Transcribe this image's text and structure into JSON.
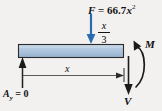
{
  "diagram": {
    "background_color": "#f2f1ef",
    "beam": {
      "fill_color": "#a8c0dc",
      "stroke_color": "#2b2b2b",
      "name": "beam-segment"
    },
    "labels": {
      "force_symbol": "F",
      "force_equals": " = 66.7",
      "force_variable": "x",
      "force_exponent": "2",
      "force_full": "F = 66.7x²",
      "centroid_numerator": "x",
      "centroid_denominator": "3",
      "centroid_full": "x/3",
      "length_dimension": "x",
      "reaction_symbol": "A",
      "reaction_subscript": "y",
      "reaction_equals": " = 0",
      "reaction_full": "A_y = 0",
      "moment": "M",
      "shear": "V"
    },
    "colors": {
      "force_arrow": "#2b6cb0",
      "line": "#2b2b2b",
      "beam_fill_top": "#c3d4e6",
      "beam_fill_bottom": "#9db7d4"
    },
    "icons": {
      "force_arrow": "arrow-down-icon",
      "reaction_arrow": "arrow-up-icon",
      "shear_arrow": "arrow-down-icon",
      "moment_arrow": "curved-arrow-icon",
      "dimension_arrow": "arrow-right-icon"
    }
  }
}
